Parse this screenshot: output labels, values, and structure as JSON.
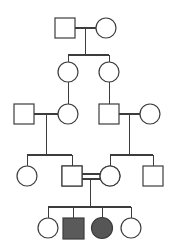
{
  "diagram": {
    "type": "pedigree",
    "canvas": {
      "width": 181,
      "height": 252,
      "background": "#ffffff"
    },
    "style": {
      "line_color": "#3c3c3c",
      "outline_color": "#3c3c3c",
      "unaffected_fill": "#ffffff",
      "affected_square_fill": "#5a5a5a",
      "affected_circle_fill": "#565656",
      "carrier_half_fill": "#6b6b6b",
      "line_width": 1.1,
      "symbol_size": 20
    },
    "legend_note": "Squares denote males, circles denote females; filled symbols are affected, half-filled symbols are carriers, double horizontal line denotes consanguineous mating.",
    "generations": [
      {
        "id": "I",
        "label": "I",
        "y": 28,
        "members": [
          {
            "id": "I-1",
            "shape": "square",
            "sex": "male",
            "status": "unaffected",
            "fill": "none",
            "cx": 65,
            "cy": 28
          },
          {
            "id": "I-2",
            "shape": "circle",
            "sex": "female",
            "status": "unaffected",
            "fill": "none",
            "cx": 106,
            "cy": 28
          }
        ]
      },
      {
        "id": "II",
        "label": "II",
        "y": 72,
        "members": [
          {
            "id": "II-1",
            "shape": "circle",
            "sex": "female",
            "status": "unaffected",
            "fill": "none",
            "cx": 68,
            "cy": 72
          },
          {
            "id": "II-2",
            "shape": "circle",
            "sex": "female",
            "status": "unaffected",
            "fill": "none",
            "cx": 109,
            "cy": 72
          }
        ]
      },
      {
        "id": "III",
        "label": "III",
        "y": 114,
        "members": [
          {
            "id": "III-1",
            "shape": "square",
            "sex": "male",
            "status": "unaffected",
            "fill": "none",
            "cx": 24,
            "cy": 114
          },
          {
            "id": "III-2",
            "shape": "circle",
            "sex": "female",
            "status": "unaffected",
            "fill": "none",
            "cx": 68,
            "cy": 114
          },
          {
            "id": "III-3",
            "shape": "square",
            "sex": "male",
            "status": "unaffected",
            "fill": "none",
            "cx": 109,
            "cy": 114
          },
          {
            "id": "III-4",
            "shape": "circle",
            "sex": "female",
            "status": "unaffected",
            "fill": "none",
            "cx": 150,
            "cy": 114
          }
        ]
      },
      {
        "id": "IV",
        "label": "IV",
        "y": 176,
        "members": [
          {
            "id": "IV-1",
            "shape": "circle",
            "sex": "female",
            "status": "unaffected",
            "fill": "none",
            "cx": 27,
            "cy": 176
          },
          {
            "id": "IV-2",
            "shape": "square",
            "sex": "male",
            "status": "carrier",
            "fill": "half-right",
            "cx": 72,
            "cy": 176
          },
          {
            "id": "IV-3",
            "shape": "circle",
            "sex": "female",
            "status": "carrier",
            "fill": "half-right",
            "cx": 110,
            "cy": 176
          },
          {
            "id": "IV-4",
            "shape": "square",
            "sex": "male",
            "status": "unaffected",
            "fill": "none",
            "cx": 153,
            "cy": 176
          }
        ]
      },
      {
        "id": "V",
        "label": "V",
        "y": 228,
        "members": [
          {
            "id": "V-1",
            "shape": "circle",
            "sex": "female",
            "status": "unaffected",
            "fill": "none",
            "cx": 48,
            "cy": 228
          },
          {
            "id": "V-2",
            "shape": "square",
            "sex": "male",
            "status": "affected",
            "fill": "full",
            "cx": 73,
            "cy": 228
          },
          {
            "id": "V-3",
            "shape": "circle",
            "sex": "female",
            "status": "affected",
            "fill": "full",
            "cx": 102,
            "cy": 228
          },
          {
            "id": "V-4",
            "shape": "circle",
            "sex": "female",
            "status": "unaffected",
            "fill": "none",
            "cx": 131,
            "cy": 228
          }
        ]
      }
    ],
    "matings": [
      {
        "id": "mating-I",
        "partners": [
          "I-1",
          "I-2"
        ],
        "consanguineous": false,
        "children": [
          "II-1",
          "II-2"
        ]
      },
      {
        "id": "mating-III-left",
        "partners": [
          "III-1",
          "III-2"
        ],
        "consanguineous": false,
        "children": [
          "IV-1",
          "IV-2"
        ]
      },
      {
        "id": "mating-III-right",
        "partners": [
          "III-3",
          "III-4"
        ],
        "consanguineous": false,
        "children": [
          "IV-3",
          "IV-4"
        ]
      },
      {
        "id": "mating-IV",
        "partners": [
          "IV-2",
          "IV-3"
        ],
        "consanguineous": true,
        "children": [
          "V-1",
          "V-2",
          "V-3",
          "V-4"
        ]
      }
    ],
    "descents": [
      {
        "id": "descent-II-1",
        "from": "II-1",
        "to": "III-2"
      },
      {
        "id": "descent-II-2",
        "from": "II-2",
        "to": "III-3"
      }
    ]
  }
}
